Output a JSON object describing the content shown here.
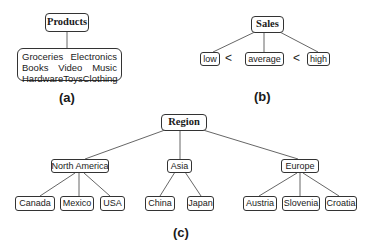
{
  "panel_a": {
    "root": "Products",
    "categories": [
      [
        "Groceries",
        "Electronics"
      ],
      [
        "Books",
        "Video",
        "Music"
      ],
      [
        "Hardware",
        "Toys",
        "Clothing"
      ]
    ],
    "caption": "(a)"
  },
  "panel_b": {
    "root": "Sales",
    "levels": [
      "low",
      "average",
      "high"
    ],
    "ordering_symbol": "<",
    "caption": "(b)"
  },
  "panel_c": {
    "root": "Region",
    "continents": [
      {
        "name": "North America",
        "countries": [
          "Canada",
          "Mexico",
          "USA"
        ]
      },
      {
        "name": "Asia",
        "countries": [
          "China",
          "Japan"
        ]
      },
      {
        "name": "Europe",
        "countries": [
          "Austria",
          "Slovenia",
          "Croatia"
        ]
      }
    ],
    "caption": "(c)"
  },
  "colors": {
    "line": "#555555",
    "border": "#333333",
    "text": "#1a1a1a"
  }
}
